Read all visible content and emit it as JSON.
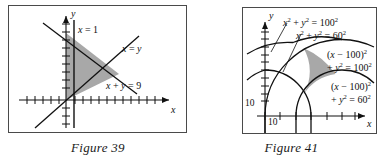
{
  "page": {
    "background": "#ffffff",
    "ink": "#111111",
    "frame_stroke": "#4a4a4a",
    "shade_fill": "#a8a8a8",
    "shade_stroke": "#333333"
  },
  "figures": [
    {
      "id": "figure-39",
      "caption": "Figure 39",
      "axes": {
        "x_name": "x",
        "y_name": "y",
        "tick_numbers": []
      },
      "curves": [
        {
          "name": "vertical-line-x-equals-1",
          "label": "x = 1",
          "kind": "line"
        },
        {
          "name": "line-x-equals-y",
          "label": "x = y",
          "kind": "line"
        },
        {
          "name": "line-x-plus-y-equals-9",
          "label": "x + y = 9",
          "kind": "line"
        }
      ],
      "labels": {
        "x_eq_1": "x = 1",
        "x_eq_y": "x = y",
        "x_plus_y_eq_9": "x + y = 9"
      },
      "shaded_region": {
        "name": "feasible-triangle",
        "description": "triangle bounded by x = 1, x = y, and x + y = 9"
      }
    },
    {
      "id": "figure-41",
      "caption": "Figure 41",
      "axes": {
        "x_name": "x",
        "y_name": "y",
        "y_tick_label": "10",
        "x_tick_label": "10"
      },
      "curves": [
        {
          "name": "circle-origin-r100",
          "label_head": "x",
          "kind": "arc"
        },
        {
          "name": "circle-origin-r60",
          "label_head": "x",
          "kind": "arc"
        },
        {
          "name": "circle-shift100-r100",
          "kind": "arc"
        },
        {
          "name": "circle-shift100-r60",
          "kind": "arc"
        }
      ],
      "labels": {
        "origin_r100": {
          "lhs_a": "x",
          "sup_a": "2",
          "plus": "+",
          "lhs_b": "y",
          "sup_b": "2",
          "eq": "=",
          "rhs": "100",
          "sup_r": "2"
        },
        "origin_r60": {
          "lhs_a": "x",
          "sup_a": "2",
          "plus": "+",
          "lhs_b": "y",
          "sup_b": "2",
          "eq": "=",
          "rhs": "60",
          "sup_r": "2"
        },
        "shift_r100_line1": {
          "open": "(",
          "v": "x",
          "minus": "−",
          "num": "100",
          "close": ")",
          "sup": "2"
        },
        "shift_r100_line2": {
          "plus": "+",
          "v": "y",
          "sup_y": "2",
          "eq": "=",
          "rhs": "100",
          "sup_r": "2"
        },
        "shift_r60_line1": {
          "open": "(",
          "v": "x",
          "minus": "−",
          "num": "100",
          "close": ")",
          "sup": "2"
        },
        "shift_r60_line2": {
          "plus": "+",
          "v": "y",
          "sup_y": "2",
          "eq": "=",
          "rhs": "60",
          "sup_r": "2"
        }
      },
      "shaded_region": {
        "name": "circle-intersection-lens",
        "description": "region between the two pairs of concentric arcs"
      }
    }
  ]
}
